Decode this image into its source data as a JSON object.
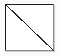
{
  "canvas": {
    "width": 60,
    "height": 56,
    "background_color": "#fbfbfb"
  },
  "figure": {
    "name": "rectangle-with-diagonal",
    "fill_color": "#ffffff",
    "stroke_color_dark": "#1b1b1b",
    "stroke_color_light": "#8d8d8d",
    "shadow_color": "#c9c9c9",
    "stroke_width": 1,
    "x": 5,
    "y": 4,
    "width": 49,
    "height": 47
  },
  "diagonal": {
    "name": "diagonal-line",
    "from_corner": "top-left",
    "to_corner": "bottom-right",
    "x1": 0,
    "y1": 0,
    "x2": 49,
    "y2": 47,
    "stroke_color": "#262626",
    "stroke_width": 1,
    "style": "solid-aliased"
  },
  "labels": {
    "title": "",
    "caption": ""
  }
}
